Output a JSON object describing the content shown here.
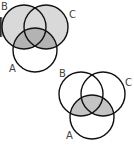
{
  "diagrams": [
    {
      "name": "venn-top",
      "labels": {
        "A": "A",
        "B": "B",
        "C": "C"
      },
      "shading": "B ∪ C shaded light; A ∩ (B ∪ C) shaded darker; A only unshaded"
    },
    {
      "name": "venn-bottom",
      "labels": {
        "A": "A",
        "B": "B",
        "C": "C"
      },
      "shading": "A ∩ (B ∪ C) shaded"
    }
  ],
  "colors": {
    "light_shade": "#d9d9d9",
    "dark_shade": "#b3b3b3",
    "outline": "#111111"
  }
}
